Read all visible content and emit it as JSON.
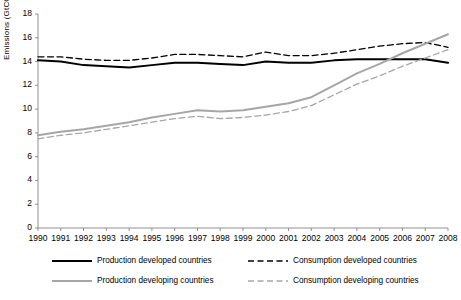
{
  "chart_data": {
    "type": "line",
    "title": "",
    "xlabel": "",
    "ylabel": "Emissions (GtCO2)",
    "ylabel_main": "Emissions (GtCO",
    "ylabel_sub": "2",
    "ylabel_close": ")",
    "x": [
      "1990",
      "1991",
      "1992",
      "1993",
      "1994",
      "1995",
      "1996",
      "1997",
      "1998",
      "1999",
      "2000",
      "2001",
      "2002",
      "2003",
      "2004",
      "2005",
      "2006",
      "2007",
      "2008"
    ],
    "ylim": [
      0,
      18
    ],
    "yticks": [
      0,
      2,
      4,
      6,
      8,
      10,
      12,
      14,
      16,
      18
    ],
    "grid": false,
    "legend_position": "bottom",
    "series": [
      {
        "name": "Production developed countries",
        "style": "solid",
        "color": "#000000",
        "values": [
          14.1,
          14.0,
          13.7,
          13.6,
          13.5,
          13.7,
          13.9,
          13.9,
          13.8,
          13.7,
          14.0,
          13.9,
          13.9,
          14.1,
          14.2,
          14.2,
          14.2,
          14.2,
          13.9
        ]
      },
      {
        "name": "Consumption developed countries",
        "style": "dashed",
        "color": "#000000",
        "values": [
          14.4,
          14.4,
          14.2,
          14.1,
          14.1,
          14.3,
          14.6,
          14.6,
          14.5,
          14.4,
          14.8,
          14.5,
          14.5,
          14.7,
          15.0,
          15.3,
          15.5,
          15.6,
          15.2
        ]
      },
      {
        "name": "Production developing countries",
        "style": "solid",
        "color": "#a6a6a6",
        "values": [
          7.8,
          8.1,
          8.3,
          8.6,
          8.9,
          9.3,
          9.6,
          9.9,
          9.8,
          9.9,
          10.2,
          10.5,
          11.0,
          12.0,
          13.0,
          13.8,
          14.7,
          15.5,
          16.3
        ]
      },
      {
        "name": "Consumption developing countries",
        "style": "dashed",
        "color": "#a6a6a6",
        "values": [
          7.5,
          7.8,
          8.0,
          8.3,
          8.6,
          8.9,
          9.2,
          9.4,
          9.2,
          9.3,
          9.5,
          9.8,
          10.3,
          11.2,
          12.1,
          12.8,
          13.6,
          14.3,
          15.0
        ]
      }
    ]
  },
  "legend": {
    "items": [
      {
        "label": "Production developed countries",
        "color": "#000000",
        "style": "solid"
      },
      {
        "label": "Consumption developed countries",
        "color": "#000000",
        "style": "dashed"
      },
      {
        "label": "Production developing countries",
        "color": "#a6a6a6",
        "style": "solid"
      },
      {
        "label": "Consumption developing countries",
        "color": "#a6a6a6",
        "style": "dashed"
      }
    ]
  }
}
